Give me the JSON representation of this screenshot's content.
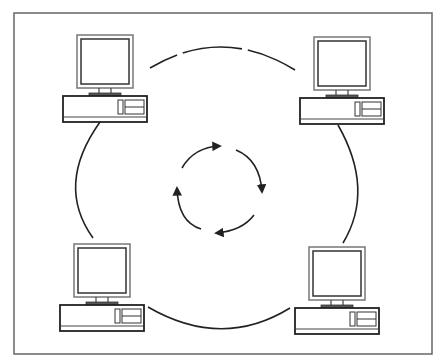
{
  "diagram": {
    "type": "ring-network",
    "frame": {
      "x": 14,
      "y": 13,
      "width": 418,
      "height": 341,
      "stroke": "#666666"
    },
    "ring": {
      "cx": 222,
      "cy": 188,
      "r": 146,
      "stroke": "#222222"
    },
    "flow": {
      "cx": 218,
      "cy": 185,
      "r": 46,
      "direction": "clockwise",
      "arrow_count": 4,
      "stroke": "#222222"
    },
    "nodes": [
      {
        "id": "computer-top-left",
        "x": 63,
        "y": 35
      },
      {
        "id": "computer-top-right",
        "x": 300,
        "y": 37
      },
      {
        "id": "computer-bottom-left",
        "x": 60,
        "y": 244
      },
      {
        "id": "computer-bottom-right",
        "x": 295,
        "y": 247
      }
    ],
    "colors": {
      "line": "#222222",
      "monitor_outline": "#555555",
      "base_fill": "#ffffff"
    }
  }
}
